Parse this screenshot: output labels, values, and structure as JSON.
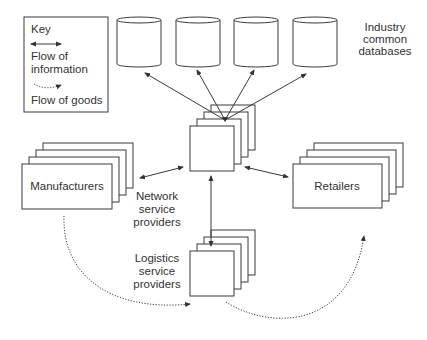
{
  "key": {
    "title": "Key",
    "info_label_line1": "Flow of",
    "info_label_line2": "information",
    "goods_label": "Flow of goods"
  },
  "databases": {
    "count": 4,
    "label_line1": "Industry",
    "label_line2": "common",
    "label_line3": "databases"
  },
  "nodes": {
    "manufacturers": "Manufacturers",
    "retailers": "Retailers",
    "network": {
      "line1": "Network",
      "line2": "service",
      "line3": "providers"
    },
    "logistics": {
      "line1": "Logistics",
      "line2": "service",
      "line3": "providers"
    }
  },
  "colors": {
    "stroke": "#3a3a3a",
    "text": "#333333",
    "background": "#ffffff"
  }
}
